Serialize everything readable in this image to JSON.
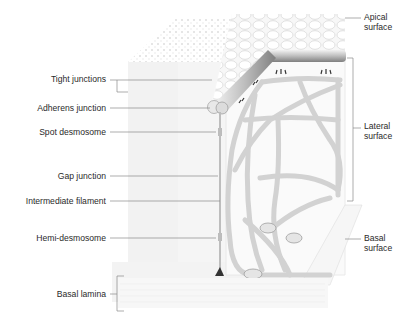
{
  "diagram": {
    "colors": {
      "label_text": "#2a2a2a",
      "leader_line": "#8a8a8a",
      "cell_fill": "#f4f4f4",
      "filament": "#d4d4d4",
      "rod_dark": "#9a9a9a"
    },
    "left_labels": [
      {
        "id": "tight-junctions",
        "text": "Tight junctions"
      },
      {
        "id": "adherens-junction",
        "text": "Adherens junction"
      },
      {
        "id": "spot-desmosome",
        "text": "Spot desmosome"
      },
      {
        "id": "gap-junction",
        "text": "Gap junction"
      },
      {
        "id": "intermediate-filament",
        "text": "Intermediate filament"
      },
      {
        "id": "hemi-desmosome",
        "text": "Hemi-desmosome"
      },
      {
        "id": "basal-lamina",
        "text": "Basal lamina"
      }
    ],
    "right_labels": [
      {
        "id": "apical-surface",
        "line1": "Apical",
        "line2": "surface"
      },
      {
        "id": "lateral-surface",
        "line1": "Lateral",
        "line2": "surface"
      },
      {
        "id": "basal-surface",
        "line1": "Basal",
        "line2": "surface"
      }
    ]
  }
}
